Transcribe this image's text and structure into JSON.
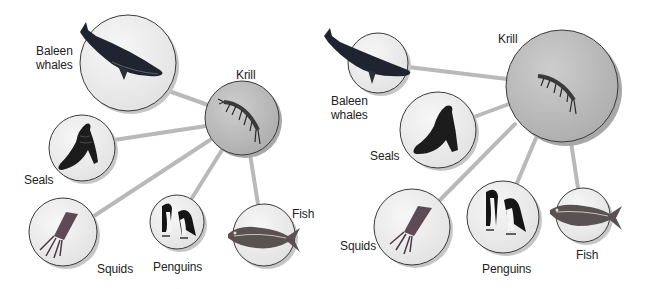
{
  "colors": {
    "background": "#ffffff",
    "link_line": "#b9b9b9",
    "circle_fill": "#ececec",
    "circle_stroke": "#3a3a3a",
    "circle_shadow": "#bdbdbd",
    "krill_fill": "#bcbcbc",
    "label_text": "#222222"
  },
  "diagrams": [
    {
      "id": "left",
      "center_node": "Krill",
      "nodes": [
        {
          "key": "baleen_whales",
          "label": "Baleen\nwhales",
          "icon": "whale-icon"
        },
        {
          "key": "krill",
          "label": "Krill",
          "icon": "krill-icon"
        },
        {
          "key": "seals",
          "label": "Seals",
          "icon": "seal-icon"
        },
        {
          "key": "squids",
          "label": "Squids",
          "icon": "squid-icon"
        },
        {
          "key": "penguins",
          "label": "Penguins",
          "icon": "penguin-icon"
        },
        {
          "key": "fish",
          "label": "Fish",
          "icon": "fish-icon"
        }
      ]
    },
    {
      "id": "right",
      "center_node": "Krill",
      "nodes": [
        {
          "key": "baleen_whales",
          "label": "Baleen\nwhales",
          "icon": "whale-icon"
        },
        {
          "key": "krill",
          "label": "Krill",
          "icon": "krill-icon"
        },
        {
          "key": "seals",
          "label": "Seals",
          "icon": "seal-icon"
        },
        {
          "key": "squids",
          "label": "Squids",
          "icon": "squid-icon"
        },
        {
          "key": "penguins",
          "label": "Penguins",
          "icon": "penguin-icon"
        },
        {
          "key": "fish",
          "label": "Fish",
          "icon": "fish-icon"
        }
      ]
    }
  ]
}
